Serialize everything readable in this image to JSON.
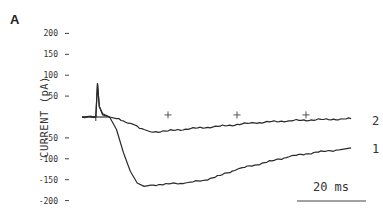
{
  "panel_label": "A",
  "chart_data": {
    "type": "line",
    "title": "",
    "xlabel": "",
    "ylabel": "CURRENT (pA)",
    "yticks": [
      200,
      150,
      100,
      50,
      -50,
      -100,
      -150,
      -200
    ],
    "ytick_labels": [
      "200",
      "150",
      "100",
      "50",
      "-50",
      "-100",
      "-150",
      "-200"
    ],
    "ylim": [
      -200,
      200
    ],
    "grid": false,
    "x_units": "ms",
    "x_scale_bar": {
      "value": 20,
      "label": "20 ms"
    },
    "markers": [
      {
        "type": "cross",
        "x_ms": 20,
        "y": 5
      },
      {
        "type": "cross",
        "x_ms": 40,
        "y": 5
      },
      {
        "type": "cross",
        "x_ms": 60,
        "y": 5
      }
    ],
    "series": [
      {
        "name": "1",
        "x_ms": [
          0,
          4,
          4.5,
          5,
          6,
          8,
          10,
          12,
          14,
          16,
          18,
          20,
          25,
          30,
          35,
          40,
          45,
          50,
          55,
          60,
          65,
          70,
          75,
          78
        ],
        "values": [
          0,
          0,
          80,
          25,
          5,
          0,
          -30,
          -85,
          -130,
          -158,
          -166,
          -163,
          -160,
          -158,
          -152,
          -140,
          -125,
          -115,
          -105,
          -95,
          -88,
          -82,
          -78,
          -74
        ]
      },
      {
        "name": "2",
        "x_ms": [
          0,
          4,
          4.5,
          5,
          6,
          8,
          10,
          14,
          18,
          20,
          25,
          30,
          40,
          50,
          60,
          70,
          78
        ],
        "values": [
          0,
          0,
          80,
          25,
          8,
          0,
          -4,
          -15,
          -30,
          -36,
          -33,
          -29,
          -22,
          -14,
          -9,
          -6,
          -4
        ]
      }
    ],
    "legend": "inline labels at trace ends"
  },
  "labels": {
    "ylabel": "CURRENT  (pA)",
    "trace_1": "1",
    "trace_2": "2",
    "scale": "20  ms"
  }
}
